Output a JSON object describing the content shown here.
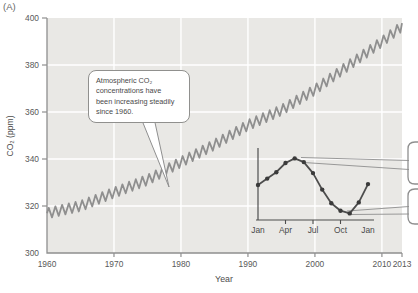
{
  "panel_label": "(A)",
  "colors": {
    "plot_bg": "#e9e8e5",
    "grid": "#ffffff",
    "axis": "#8f8f8f",
    "curve": "#8f8f8f",
    "inset_line": "#4d4d4d",
    "inset_dot": "#3b3b3b",
    "tick_text": "#595959",
    "inset_text": "#4a4a4a"
  },
  "chart_data": [
    {
      "id": "main-keeling-curve",
      "type": "line",
      "title": "",
      "xlabel": "Year",
      "ylabel": "CO₂ (ppm)",
      "xlim": [
        1960,
        2013
      ],
      "ylim": [
        300,
        400
      ],
      "x_ticks": [
        1960,
        1970,
        1980,
        1990,
        2000,
        2010,
        2013
      ],
      "y_ticks": [
        300,
        320,
        340,
        360,
        380,
        400
      ],
      "grid": true,
      "legend": "none",
      "annotation": "Atmospheric CO₂\nconcentrations have\nbeen increasing steadily\nsince 1960.",
      "series": [
        {
          "name": "Atmospheric CO₂ concentration (seasonally oscillating upward trend)",
          "trend_years": [
            1960,
            1965,
            1970,
            1975,
            1980,
            1985,
            1990,
            1995,
            2000,
            2005,
            2010,
            2013
          ],
          "trend_values": [
            316.9,
            320.0,
            325.7,
            331.1,
            338.7,
            346.1,
            354.4,
            360.8,
            369.5,
            379.8,
            389.9,
            396.5
          ],
          "seasonal_amplitude_ppm": 2.2
        }
      ]
    },
    {
      "id": "inset-seasonal-cycle",
      "type": "line",
      "title": "",
      "x_tick_labels": [
        "Jan",
        "Apr",
        "Jul",
        "Oct",
        "Jan"
      ],
      "months": [
        "Jan",
        "Feb",
        "Mar",
        "Apr",
        "May",
        "Jun",
        "Jul",
        "Aug",
        "Sep",
        "Oct",
        "Nov",
        "Dec",
        "Jan"
      ],
      "relative_ppm": [
        0,
        0.7,
        1.4,
        2.4,
        2.9,
        2.5,
        1.3,
        -0.5,
        -2.0,
        -2.8,
        -3.1,
        -1.9,
        0.1
      ]
    }
  ]
}
